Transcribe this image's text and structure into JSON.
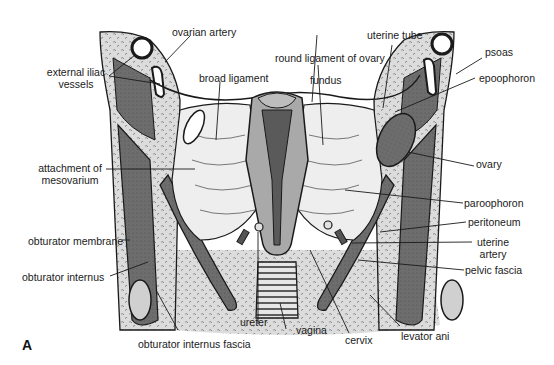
{
  "figure": {
    "panel_letter": "A",
    "colors": {
      "background": "#ffffff",
      "muscle_dark": "#6f6f6f",
      "tissue_light": "#d9d9d9",
      "ligament": "#ececec",
      "uterus_wall": "#a9a9a9",
      "cavity": "#5a5a5a",
      "line": "#1a1a1a"
    }
  },
  "labels": {
    "ovarian_artery": "ovarian artery",
    "external_iliac_line1": "external iliac",
    "external_iliac_line2": "vessels",
    "broad_ligament": "broad ligament",
    "attachment_line1": "attachment of",
    "attachment_line2": "mesovarium",
    "obturator_membrane": "obturator membrane",
    "obturator_internus": "obturator internus",
    "obturator_internus_fascia": "obturator internus fascia",
    "ureter": "ureter",
    "vagina": "vagina",
    "cervix": "cervix",
    "levator_ani": "levator ani",
    "round_ligament": "round ligament of ovary",
    "fundus": "fundus",
    "uterine_tube": "uterine tube",
    "psoas": "psoas",
    "epoophoron": "epoophoron",
    "ovary": "ovary",
    "paroophoron": "paroophoron",
    "peritoneum": "peritoneum",
    "uterine_artery_line1": "uterine",
    "uterine_artery_line2": "artery",
    "pelvic_fascia": "pelvic fascia"
  }
}
